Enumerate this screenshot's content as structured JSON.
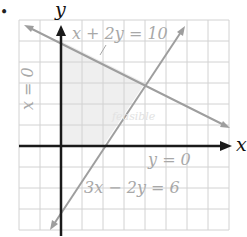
{
  "figure": {
    "bullet": "•",
    "axes": {
      "x_label": "x",
      "y_label": "y"
    },
    "lines": [
      {
        "id": "line1",
        "equation": "x + 2y = 10",
        "color": "#a9a9a9"
      },
      {
        "id": "line2",
        "equation": "3x − 2y = 6",
        "color": "#a9a9a9"
      },
      {
        "id": "line3",
        "equation": "x = 0"
      },
      {
        "id": "line4",
        "equation": "y = 0"
      }
    ],
    "region_label": "feasible",
    "colors": {
      "grid": "#cfcfcf",
      "axis": "#1a1a1a",
      "constraint_line": "#a0a0a0",
      "label": "#a8a8a8",
      "shade": "#ececec"
    },
    "grid": {
      "x_min": -2,
      "x_max": 8,
      "y_min": -4,
      "y_max": 6
    }
  }
}
